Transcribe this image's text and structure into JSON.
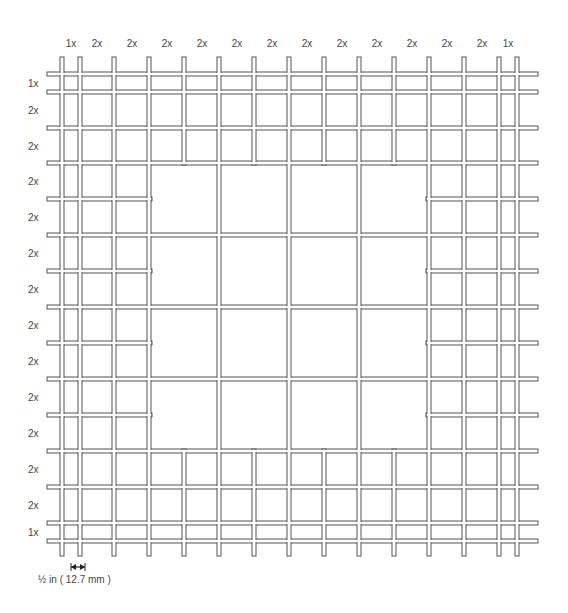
{
  "diagram": {
    "column_labels": [
      "1x",
      "2x",
      "2x",
      "2x",
      "2x",
      "2x",
      "2x",
      "2x",
      "2x",
      "2x",
      "2x",
      "2x",
      "2x",
      "1x"
    ],
    "row_labels": [
      "1x",
      "2x",
      "2x",
      "2x",
      "2x",
      "2x",
      "2x",
      "2x",
      "2x",
      "2x",
      "2x",
      "2x",
      "2x",
      "1x"
    ],
    "scale": {
      "label": "½ in ( 12.7 mm )",
      "arrow_icon": "double-arrow-icon"
    },
    "wire_color": "#555555",
    "wire_fill": "#ffffff",
    "vertical_wires_x": [
      62,
      80,
      114,
      149,
      184,
      219,
      254,
      289,
      324,
      359,
      394,
      429,
      464,
      499,
      517
    ],
    "horizontal_wires_y": [
      74,
      92,
      128,
      163,
      199,
      235,
      271,
      307,
      343,
      379,
      415,
      451,
      487,
      523,
      541
    ],
    "column_label_x": [
      71,
      97,
      132,
      167,
      202,
      237,
      272,
      307,
      342,
      377,
      412,
      447,
      482,
      508
    ],
    "row_label_y": [
      83,
      110,
      146,
      181,
      217,
      253,
      289,
      325,
      361,
      397,
      433,
      469,
      505,
      532
    ]
  }
}
